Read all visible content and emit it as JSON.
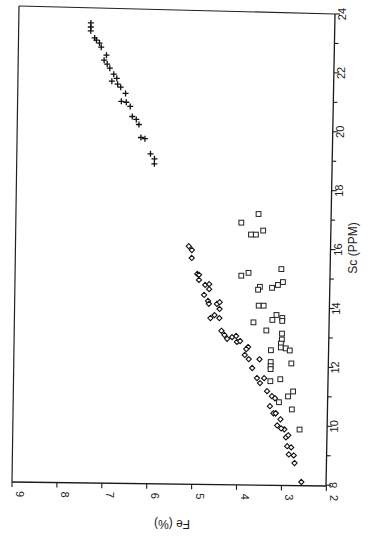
{
  "chart_data": {
    "type": "scatter",
    "orientation": "rotated 90 degrees counter-clockwise (Fe axis along bottom reading upside-down, Sc axis along right side)",
    "title": "",
    "xlabel": "Sc (PPM)",
    "ylabel": "Fe (%)",
    "xlim": [
      8,
      24
    ],
    "ylim": [
      2,
      9
    ],
    "x_ticks": [
      8,
      10,
      12,
      14,
      16,
      18,
      20,
      22,
      24
    ],
    "y_ticks": [
      2,
      3,
      4,
      5,
      6,
      7,
      8,
      9
    ],
    "grid": false,
    "legend": null,
    "series": [
      {
        "name": "plus markers",
        "marker": "plus",
        "points": [
          {
            "sc": 23.73,
            "fe": 7.24
          },
          {
            "sc": 23.59,
            "fe": 7.24
          },
          {
            "sc": 23.46,
            "fe": 7.24
          },
          {
            "sc": 23.22,
            "fe": 7.15
          },
          {
            "sc": 23.15,
            "fe": 7.11
          },
          {
            "sc": 23.05,
            "fe": 7.04
          },
          {
            "sc": 22.91,
            "fe": 7.0
          },
          {
            "sc": 22.64,
            "fe": 6.88
          },
          {
            "sc": 22.47,
            "fe": 6.93
          },
          {
            "sc": 22.34,
            "fe": 6.86
          },
          {
            "sc": 22.2,
            "fe": 6.8
          },
          {
            "sc": 22.0,
            "fe": 6.71
          },
          {
            "sc": 21.86,
            "fe": 6.64
          },
          {
            "sc": 21.76,
            "fe": 6.75
          },
          {
            "sc": 21.66,
            "fe": 6.62
          },
          {
            "sc": 21.56,
            "fe": 6.55
          },
          {
            "sc": 21.35,
            "fe": 6.44
          },
          {
            "sc": 21.08,
            "fe": 6.53
          },
          {
            "sc": 21.05,
            "fe": 6.42
          },
          {
            "sc": 20.91,
            "fe": 6.33
          },
          {
            "sc": 20.57,
            "fe": 6.28
          },
          {
            "sc": 20.47,
            "fe": 6.19
          },
          {
            "sc": 20.3,
            "fe": 6.13
          },
          {
            "sc": 19.86,
            "fe": 6.08
          },
          {
            "sc": 19.82,
            "fe": 5.99
          },
          {
            "sc": 19.31,
            "fe": 5.86
          },
          {
            "sc": 19.14,
            "fe": 5.77
          },
          {
            "sc": 18.97,
            "fe": 5.77
          }
        ]
      },
      {
        "name": "diamond markers",
        "marker": "diamond",
        "points": [
          {
            "sc": 16.19,
            "fe": 4.97
          },
          {
            "sc": 16.06,
            "fe": 4.9
          },
          {
            "sc": 15.79,
            "fe": 4.9
          },
          {
            "sc": 15.25,
            "fe": 4.77
          },
          {
            "sc": 15.22,
            "fe": 4.73
          },
          {
            "sc": 15.05,
            "fe": 4.73
          },
          {
            "sc": 14.88,
            "fe": 4.59
          },
          {
            "sc": 14.91,
            "fe": 4.5
          },
          {
            "sc": 14.74,
            "fe": 4.5
          },
          {
            "sc": 14.54,
            "fe": 4.61
          },
          {
            "sc": 14.34,
            "fe": 4.52
          },
          {
            "sc": 14.24,
            "fe": 4.5
          },
          {
            "sc": 14.24,
            "fe": 4.32
          },
          {
            "sc": 14.3,
            "fe": 4.26
          },
          {
            "sc": 14.07,
            "fe": 4.26
          },
          {
            "sc": 13.76,
            "fe": 4.46
          },
          {
            "sc": 13.86,
            "fe": 4.37
          },
          {
            "sc": 13.76,
            "fe": 4.26
          },
          {
            "sc": 13.33,
            "fe": 4.21
          },
          {
            "sc": 13.19,
            "fe": 4.14
          },
          {
            "sc": 13.06,
            "fe": 4.08
          },
          {
            "sc": 13.12,
            "fe": 3.97
          },
          {
            "sc": 12.96,
            "fe": 3.86
          },
          {
            "sc": 13.16,
            "fe": 3.88
          },
          {
            "sc": 12.99,
            "fe": 3.79
          },
          {
            "sc": 12.79,
            "fe": 3.61
          },
          {
            "sc": 12.72,
            "fe": 3.65
          },
          {
            "sc": 12.52,
            "fe": 3.68
          },
          {
            "sc": 12.38,
            "fe": 3.59
          },
          {
            "sc": 12.38,
            "fe": 3.35
          },
          {
            "sc": 12.08,
            "fe": 3.51
          },
          {
            "sc": 11.74,
            "fe": 3.4
          },
          {
            "sc": 11.74,
            "fe": 3.24
          },
          {
            "sc": 11.57,
            "fe": 3.33
          },
          {
            "sc": 11.3,
            "fe": 3.17
          },
          {
            "sc": 11.13,
            "fe": 3.06
          },
          {
            "sc": 11.06,
            "fe": 2.99
          },
          {
            "sc": 10.79,
            "fe": 3.1
          },
          {
            "sc": 10.55,
            "fe": 2.97
          },
          {
            "sc": 10.55,
            "fe": 3.02
          },
          {
            "sc": 10.55,
            "fe": 2.97
          },
          {
            "sc": 10.35,
            "fe": 2.86
          },
          {
            "sc": 10.14,
            "fe": 2.93
          },
          {
            "sc": 10.01,
            "fe": 2.77
          },
          {
            "sc": 9.74,
            "fe": 2.73
          },
          {
            "sc": 9.44,
            "fe": 2.7
          },
          {
            "sc": 9.4,
            "fe": 2.61
          },
          {
            "sc": 9.13,
            "fe": 2.55
          },
          {
            "sc": 10.04,
            "fe": 2.84
          },
          {
            "sc": 9.81,
            "fe": 2.68
          },
          {
            "sc": 9.16,
            "fe": 2.66
          },
          {
            "sc": 8.87,
            "fe": 2.53
          },
          {
            "sc": 8.23,
            "fe": 2.37
          }
        ]
      },
      {
        "name": "square markers",
        "marker": "square",
        "points": [
          {
            "sc": 17.31,
            "fe": 3.43
          },
          {
            "sc": 17.01,
            "fe": 3.81
          },
          {
            "sc": 16.61,
            "fe": 3.59
          },
          {
            "sc": 16.61,
            "fe": 3.48
          },
          {
            "sc": 16.75,
            "fe": 3.32
          },
          {
            "sc": 15.21,
            "fe": 3.79
          },
          {
            "sc": 15.31,
            "fe": 3.63
          },
          {
            "sc": 15.45,
            "fe": 2.9
          },
          {
            "sc": 14.84,
            "fe": 3.37
          },
          {
            "sc": 14.74,
            "fe": 3.41
          },
          {
            "sc": 14.81,
            "fe": 3.1
          },
          {
            "sc": 14.91,
            "fe": 2.97
          },
          {
            "sc": 15.01,
            "fe": 2.86
          },
          {
            "sc": 14.2,
            "fe": 3.39
          },
          {
            "sc": 14.2,
            "fe": 3.28
          },
          {
            "sc": 13.89,
            "fe": 2.99
          },
          {
            "sc": 13.72,
            "fe": 3.08
          },
          {
            "sc": 13.79,
            "fe": 2.86
          },
          {
            "sc": 13.69,
            "fe": 2.86
          },
          {
            "sc": 13.63,
            "fe": 3.5
          },
          {
            "sc": 13.36,
            "fe": 3.21
          },
          {
            "sc": 13.26,
            "fe": 2.86
          },
          {
            "sc": 13.06,
            "fe": 2.86
          },
          {
            "sc": 12.92,
            "fe": 2.88
          },
          {
            "sc": 12.69,
            "fe": 3.1
          },
          {
            "sc": 12.79,
            "fe": 2.88
          },
          {
            "sc": 12.76,
            "fe": 2.77
          },
          {
            "sc": 12.69,
            "fe": 2.68
          },
          {
            "sc": 12.29,
            "fe": 3.1
          },
          {
            "sc": 12.15,
            "fe": 3.1
          },
          {
            "sc": 12.05,
            "fe": 3.1
          },
          {
            "sc": 12.25,
            "fe": 2.64
          },
          {
            "sc": 11.71,
            "fe": 2.88
          },
          {
            "sc": 11.64,
            "fe": 3.1
          },
          {
            "sc": 11.3,
            "fe": 2.59
          },
          {
            "sc": 11.13,
            "fe": 2.7
          },
          {
            "sc": 10.93,
            "fe": 2.9
          },
          {
            "sc": 10.69,
            "fe": 2.61
          },
          {
            "sc": 10.01,
            "fe": 2.43
          }
        ]
      }
    ],
    "annotations": []
  },
  "axes": {
    "sc_title": "Sc (PPM)",
    "fe_title": "Fe (%)",
    "sc_tick_labels": [
      "8",
      "10",
      "12",
      "14",
      "16",
      "18",
      "20",
      "22",
      "24"
    ],
    "fe_tick_labels": [
      "2",
      "3",
      "4",
      "5",
      "6",
      "7",
      "8",
      "9"
    ]
  },
  "colors": {
    "ink": "#111111",
    "background": "#ffffff"
  }
}
